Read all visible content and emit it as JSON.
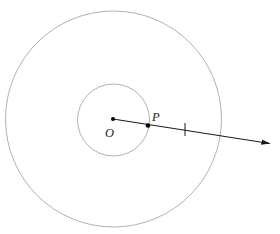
{
  "figure": {
    "background_color": "#ffffff",
    "width": 280,
    "height": 234
  },
  "style": {
    "circle_stroke_color": "#a8a8a8",
    "circle_stroke_width": 0.9,
    "ray_stroke_color": "#1a1a1a",
    "ray_stroke_width": 1.0,
    "point_fill_color": "#000000",
    "label_color": "#1a1a1a",
    "tick_stroke_color": "#1a1a1a",
    "tick_stroke_width": 1.0
  },
  "shapes": {
    "outer_circle": {
      "name": "outer-circle",
      "cx": 113.5,
      "cy": 119,
      "r": 108
    },
    "inner_circle": {
      "name": "inner-circle",
      "cx": 113.5,
      "cy": 120,
      "r": 36
    }
  },
  "points": [
    {
      "id": "O",
      "label": "O",
      "cx": 113,
      "cy": 119,
      "r": 2.0,
      "label_x": 105,
      "label_y": 137,
      "description": "center of both circles"
    },
    {
      "id": "P",
      "label": "P",
      "cx": 148,
      "cy": 125.5,
      "r": 2.3,
      "label_x": 152,
      "label_y": 121,
      "description": "point on the inner circle where the ray crosses"
    }
  ],
  "ray": {
    "name": "ray-OP",
    "x1": 113,
    "y1": 119,
    "x2": 273,
    "y2": 144,
    "arrowhead": "at-far-end",
    "arrow_tip_x": 273,
    "arrow_tip_y": 144
  },
  "tick_mark": {
    "name": "congruence-tick",
    "x1": 185,
    "y1": 123,
    "x2": 185,
    "y2": 136,
    "count": 1
  }
}
